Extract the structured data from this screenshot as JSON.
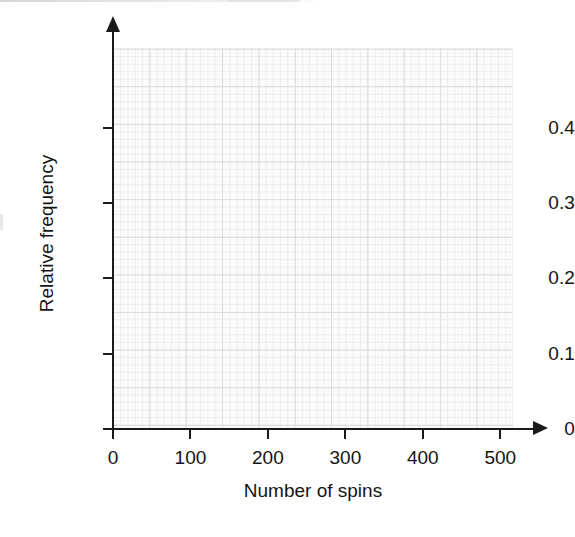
{
  "chart_data": {
    "type": "line",
    "title": "",
    "subtitle": "",
    "xlabel": "Number of spins",
    "ylabel": "Relative frequency",
    "x": [],
    "values": [],
    "series": [],
    "annotations": [],
    "legend": null,
    "legend_position": "none",
    "grid": true,
    "grid_major_step_x": 50,
    "grid_minor_step_x": 10,
    "grid_major_step_y": 0.05,
    "grid_minor_step_y": 0.01,
    "xlim": [
      0,
      550
    ],
    "ylim": [
      0,
      0.506
    ],
    "xticks": [
      0,
      100,
      200,
      300,
      400,
      500
    ],
    "yticks": [
      0,
      0.1,
      0.2,
      0.3,
      0.4
    ],
    "xtick_labels": [
      "0",
      "100",
      "200",
      "300",
      "400",
      "500"
    ],
    "ytick_labels": [
      "0",
      "0.1",
      "0.2",
      "0.3",
      "0.4"
    ],
    "colors": {
      "axis": "#1a1a1a",
      "text": "#141414",
      "plot_background": "#fbfbfc",
      "grid_major": "#dcdce0",
      "grid_minor": "#ececef",
      "page_background": "#ffffff"
    }
  },
  "axes": {
    "x": {
      "title": "Number of spins",
      "ticks": [
        {
          "label": "0",
          "value": 0
        },
        {
          "label": "100",
          "value": 100
        },
        {
          "label": "200",
          "value": 200
        },
        {
          "label": "300",
          "value": 300
        },
        {
          "label": "400",
          "value": 400
        },
        {
          "label": "500",
          "value": 500
        }
      ]
    },
    "y": {
      "title": "Relative frequency",
      "ticks": [
        {
          "label": "0",
          "value": 0
        },
        {
          "label": "0.1",
          "value": 0.1
        },
        {
          "label": "0.2",
          "value": 0.2
        },
        {
          "label": "0.3",
          "value": 0.3
        },
        {
          "label": "0.4",
          "value": 0.4
        }
      ]
    }
  }
}
